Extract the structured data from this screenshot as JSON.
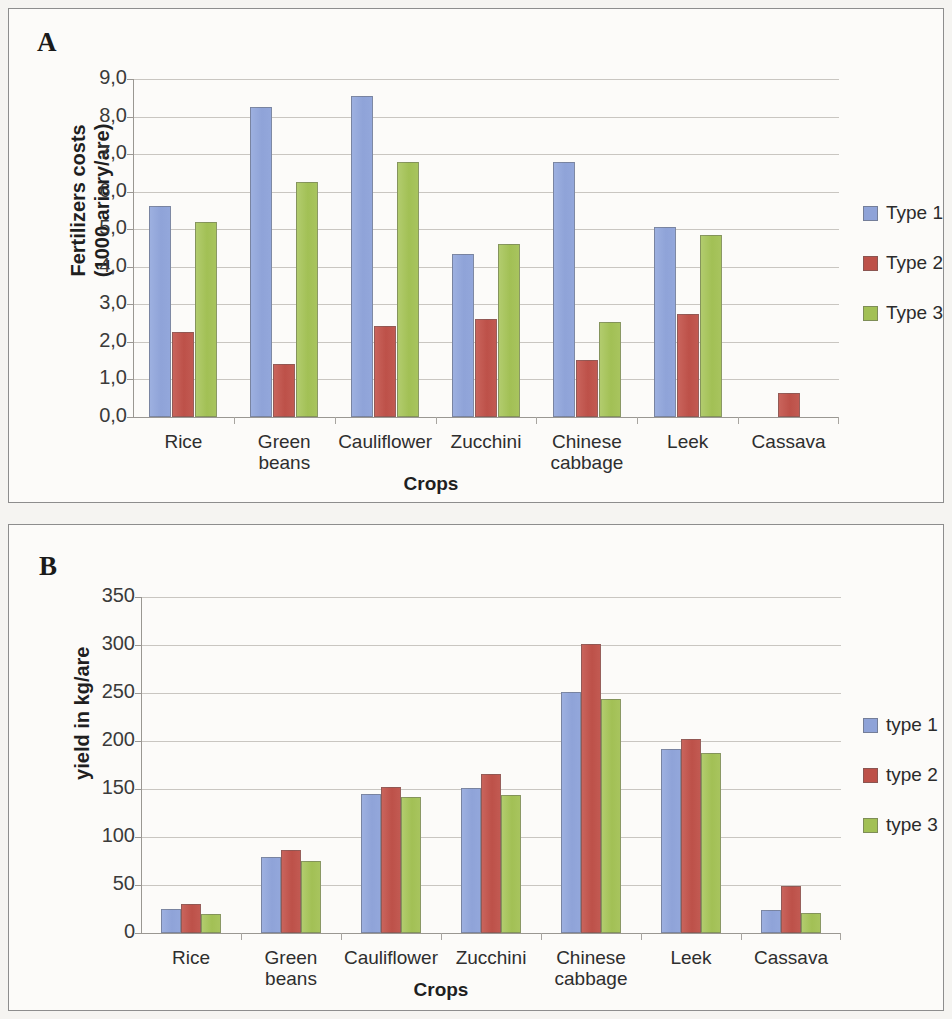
{
  "figure": {
    "panels": [
      {
        "letter": "A",
        "ylabel": "Fertilizers costs\n(1000 ariary/are)",
        "xlabel": "Crops",
        "legend_labels": [
          "Type 1",
          "Type 2",
          "Type 3"
        ]
      },
      {
        "letter": "B",
        "ylabel": "yield in  kg/are",
        "xlabel": "Crops",
        "legend_labels": [
          "type 1",
          "type 2",
          "type 3"
        ]
      }
    ]
  },
  "colors": {
    "type1": "#8fa3d8",
    "type2": "#bd5149",
    "type3": "#a2c055",
    "grid": "#c9c6c1",
    "axis": "#9a9792",
    "panel_bg": "#fcfbf9",
    "page_bg": "#f5f4f1"
  },
  "chart_data": [
    {
      "type": "bar",
      "panel": "A",
      "title": "",
      "xlabel": "Crops",
      "ylabel": "Fertilizers costs (1000 ariary/are)",
      "categories": [
        "Rice",
        "Green beans",
        "Cauliflower",
        "Zucchini",
        "Chinese cabbage",
        "Leek",
        "Cassava"
      ],
      "category_lines": [
        [
          "Rice"
        ],
        [
          "Green",
          "beans"
        ],
        [
          "Cauliflower"
        ],
        [
          "Zucchini"
        ],
        [
          "Chinese",
          "cabbage"
        ],
        [
          "Leek"
        ],
        [
          "Cassava"
        ]
      ],
      "series": [
        {
          "name": "Type 1",
          "color": "#8fa3d8",
          "values": [
            5.62,
            8.25,
            8.55,
            4.35,
            6.8,
            5.05,
            0
          ]
        },
        {
          "name": "Type 2",
          "color": "#bd5149",
          "values": [
            2.25,
            1.4,
            2.42,
            2.6,
            1.52,
            2.75,
            0.65
          ]
        },
        {
          "name": "Type 3",
          "color": "#a2c055",
          "values": [
            5.18,
            6.25,
            6.8,
            4.6,
            2.52,
            4.85,
            0
          ]
        }
      ],
      "ylim": [
        0,
        9
      ],
      "ytick_labels": [
        "0,0",
        "1,0",
        "2,0",
        "3,0",
        "4,0",
        "5,0",
        "6,0",
        "7,0",
        "8,0",
        "9,0"
      ],
      "ytick_values": [
        0,
        1,
        2,
        3,
        4,
        5,
        6,
        7,
        8,
        9
      ],
      "grid": true,
      "legend_position": "right"
    },
    {
      "type": "bar",
      "panel": "B",
      "title": "",
      "xlabel": "Crops",
      "ylabel": "yield in kg/are",
      "categories": [
        "Rice",
        "Green beans",
        "Cauliflower",
        "Zucchini",
        "Chinese cabbage",
        "Leek",
        "Cassava"
      ],
      "category_lines": [
        [
          "Rice"
        ],
        [
          "Green",
          "beans"
        ],
        [
          "Cauliflower"
        ],
        [
          "Zucchini"
        ],
        [
          "Chinese",
          "cabbage"
        ],
        [
          "Leek"
        ],
        [
          "Cassava"
        ]
      ],
      "series": [
        {
          "name": "type 1",
          "color": "#8fa3d8",
          "values": [
            25,
            79,
            145,
            151,
            251,
            192,
            24
          ]
        },
        {
          "name": "type 2",
          "color": "#bd5149",
          "values": [
            30,
            86,
            152,
            166,
            301,
            202,
            49
          ]
        },
        {
          "name": "type 3",
          "color": "#a2c055",
          "values": [
            20,
            75,
            142,
            144,
            244,
            188,
            21
          ]
        }
      ],
      "ylim": [
        0,
        350
      ],
      "ytick_labels": [
        "0",
        "50",
        "100",
        "150",
        "200",
        "250",
        "300",
        "350"
      ],
      "ytick_values": [
        0,
        50,
        100,
        150,
        200,
        250,
        300,
        350
      ],
      "grid": true,
      "legend_position": "right"
    }
  ]
}
